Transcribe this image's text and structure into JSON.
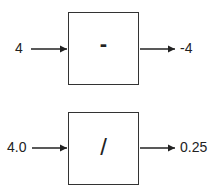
{
  "blocks": [
    {
      "input": "4",
      "operator": "-",
      "output": "-4"
    },
    {
      "input": "4.0",
      "operator": "/",
      "output": "0.25"
    }
  ],
  "colors": {
    "stroke": "#333333",
    "text": "#222222",
    "background": "#ffffff"
  }
}
